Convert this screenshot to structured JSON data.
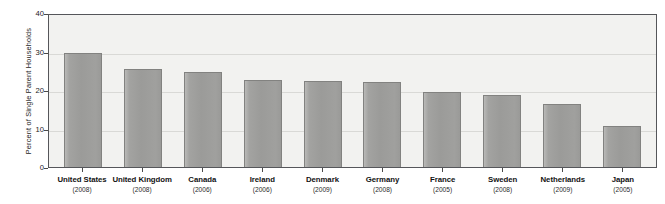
{
  "chart_data": {
    "type": "bar",
    "title": "",
    "xlabel": "",
    "ylabel": "Percent of Single Parent Households",
    "ylim": [
      0,
      40
    ],
    "yticks": [
      0,
      10,
      20,
      30,
      40
    ],
    "ytick_labels": [
      "0",
      "10",
      "20",
      "30",
      "40"
    ],
    "grid": true,
    "legend": "none",
    "categories": [
      "United States",
      "United Kingdom",
      "Canada",
      "Ireland",
      "Denmark",
      "Germany",
      "France",
      "Sweden",
      "Netherlands",
      "Japan"
    ],
    "category_years": [
      "(2008)",
      "(2008)",
      "(2006)",
      "(2006)",
      "(2009)",
      "(2008)",
      "(2005)",
      "(2008)",
      "(2009)",
      "(2005)"
    ],
    "values": [
      29.5,
      25.4,
      24.8,
      22.7,
      22.3,
      22.1,
      19.6,
      18.8,
      16.3,
      10.7
    ],
    "series": [
      {
        "name": "Percent of Single Parent Households",
        "values": [
          29.5,
          25.4,
          24.8,
          22.7,
          22.3,
          22.1,
          19.6,
          18.8,
          16.3,
          10.7
        ]
      }
    ]
  },
  "style": {
    "bar_fill": "#9b9b99",
    "bar_border": "#828280",
    "plot_background": "#f2f2f0",
    "frame_color": "#55565a",
    "gridline_color": "#d9d9d6",
    "text_color": "#121212",
    "page_background": "#ffffff"
  }
}
